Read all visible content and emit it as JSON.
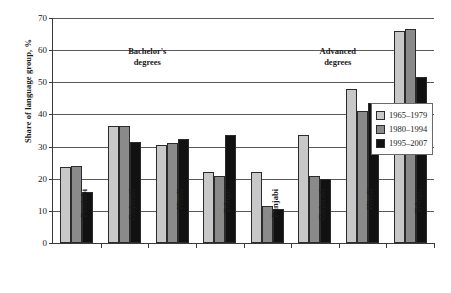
{
  "chart_data": {
    "type": "bar",
    "title": "",
    "xlabel": "",
    "ylabel": "Share of language group, %",
    "ylim": [
      0,
      70
    ],
    "ytick_step": 10,
    "yticks": [
      0,
      10,
      20,
      30,
      40,
      50,
      60,
      70
    ],
    "grid": true,
    "legend_position": "right",
    "categories": [
      "Punjabi",
      "Gujarati",
      "Hindi",
      "Telugu",
      "Punjabi",
      "Gujarati",
      "Hindi",
      "Telugu"
    ],
    "sections": [
      {
        "label_line1": "Bachelor's",
        "label_line2": "degrees",
        "categories": [
          "Punjabi",
          "Gujarati",
          "Hindi",
          "Telugu"
        ]
      },
      {
        "label_line1": "Advanced",
        "label_line2": "degrees",
        "categories": [
          "Punjabi",
          "Gujarati",
          "Hindi",
          "Telugu"
        ]
      }
    ],
    "series": [
      {
        "name": "1965–1979",
        "color": "#c8c8c8",
        "values": [
          23.5,
          36.5,
          30.5,
          22.0,
          22.0,
          33.5,
          48.0,
          66.0
        ]
      },
      {
        "name": "1980–1994",
        "color": "#8a8a8a",
        "values": [
          24.0,
          36.5,
          31.0,
          21.0,
          11.5,
          21.0,
          41.0,
          66.5
        ]
      },
      {
        "name": "1995–2007",
        "color": "#111111",
        "values": [
          16.0,
          31.5,
          32.5,
          33.5,
          10.5,
          20.0,
          43.5,
          51.5
        ]
      }
    ]
  },
  "legend": {
    "items": [
      {
        "label": "1965–1979",
        "swatch": "#c8c8c8"
      },
      {
        "label": "1980–1994",
        "swatch": "#8a8a8a"
      },
      {
        "label": "1995–2007",
        "swatch": "#111111"
      }
    ]
  }
}
